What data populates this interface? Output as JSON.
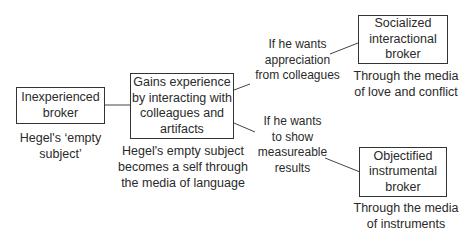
{
  "nodes": {
    "inexperienced": {
      "label": "Inexperienced\nbroker",
      "caption": "Hegel's ‘empty\nsubject’"
    },
    "gains": {
      "label": "Gains experience\nby interacting with\ncolleagues and\nartifacts",
      "caption": "Hegel's empty subject\nbecomes a self through\nthe media of language"
    },
    "socialized": {
      "label": "Socialized\ninteractional\nbroker",
      "caption": "Through the media\nof love and conflict"
    },
    "objectified": {
      "label": "Objectified\ninstrumental\nbroker",
      "caption": "Through the media\nof instruments"
    }
  },
  "edges": {
    "to_socialized": {
      "label": "If he wants\nappreciation\nfrom colleagues"
    },
    "to_objectified": {
      "label": "If he wants\nto show\nmeasureable\nresults"
    }
  }
}
